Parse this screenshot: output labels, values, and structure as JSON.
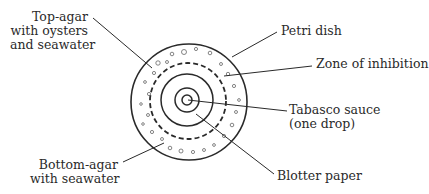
{
  "diagram": {
    "type": "labeled petri dish assay cross-section",
    "colors": {
      "ink": "#2a2a2a",
      "bubble": "#666666",
      "background": "#ffffff"
    },
    "labels": {
      "top_agar": {
        "line1": "Top-agar",
        "line2": "with oysters",
        "line3": "and seawater"
      },
      "petri_dish": "Petri dish",
      "zone_of_inhibition": "Zone of inhibition",
      "tabasco": {
        "line1": "Tabasco sauce",
        "line2": "(one drop)"
      },
      "bottom_agar": {
        "line1": "Bottom-agar",
        "line2": "with seawater"
      },
      "blotter_paper": "Blotter paper"
    }
  }
}
